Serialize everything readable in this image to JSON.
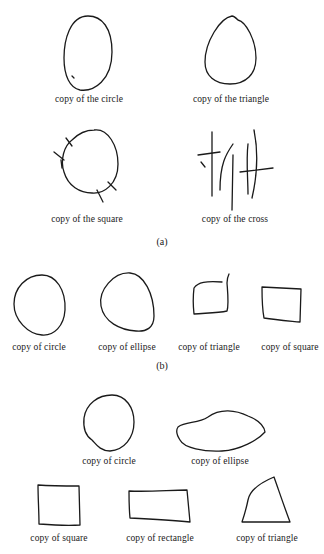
{
  "figure": {
    "panels": [
      {
        "label": "(a)",
        "captions": [
          "copy of the circle",
          "copy of the triangle",
          "copy of the square",
          "copy of the cross"
        ]
      },
      {
        "label": "(b)",
        "captions": [
          "copy of circle",
          "copy of ellipse",
          "copy of triangle",
          "copy of square"
        ]
      },
      {
        "label": "",
        "captions": [
          "copy of circle",
          "copy of ellipse",
          "copy of square",
          "copy of rectangle",
          "copy of triangle"
        ]
      }
    ]
  }
}
